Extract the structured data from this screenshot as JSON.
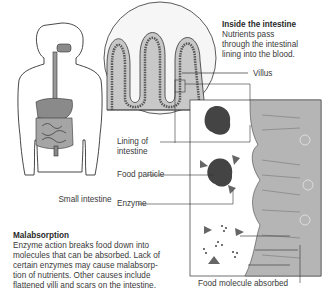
{
  "figure": {
    "body_label": "Small intestine",
    "inside": {
      "title": "Inside the intestine",
      "body": [
        "Nutrients pass",
        "through the intestinal",
        "lining into the blood."
      ]
    },
    "labels": {
      "villus": "Villus",
      "lining": [
        "Lining of",
        "intestine"
      ],
      "food_particle": "Food particle",
      "enzyme": "Enzyme",
      "food_molecule": "Food molecule absorbed"
    },
    "malabsorption": {
      "title": "Malabsorption",
      "lines": [
        "Enzyme action breaks food down into",
        "molecules that can be absorbed. Lack of",
        "certain enzymes may cause malabsorp-",
        "tion of nutrients. Other causes include",
        "flattened villi and scars on the intestine."
      ]
    },
    "colors": {
      "organ": "#8a8a8a",
      "tissue": "#b9b9b9",
      "particle": "#444444",
      "line": "#333333"
    }
  }
}
